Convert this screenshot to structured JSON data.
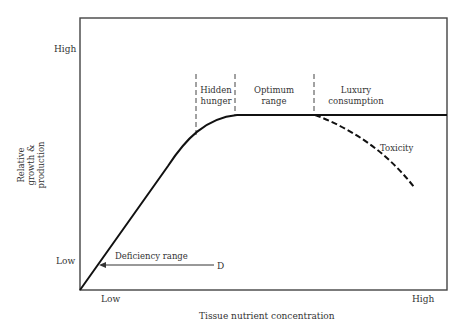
{
  "diagram": {
    "type": "concept-curve",
    "y_axis": {
      "label_lines": [
        "Relative",
        "growth &",
        "production"
      ],
      "tick_high": "High",
      "tick_low": "Low"
    },
    "x_axis": {
      "label": "Tissue nutrient concentration",
      "tick_low": "Low",
      "tick_high": "High"
    },
    "zones": [
      {
        "id": "hidden-hunger",
        "lines": [
          "Hidden",
          "hunger"
        ]
      },
      {
        "id": "optimum-range",
        "lines": [
          "Optimum",
          "range"
        ]
      },
      {
        "id": "luxury-consumption",
        "lines": [
          "Luxury",
          "consumption"
        ]
      }
    ],
    "annotations": {
      "toxicity": "Toxicity",
      "deficiency_range": "Deficiency range",
      "deficiency_marker": "D"
    }
  }
}
